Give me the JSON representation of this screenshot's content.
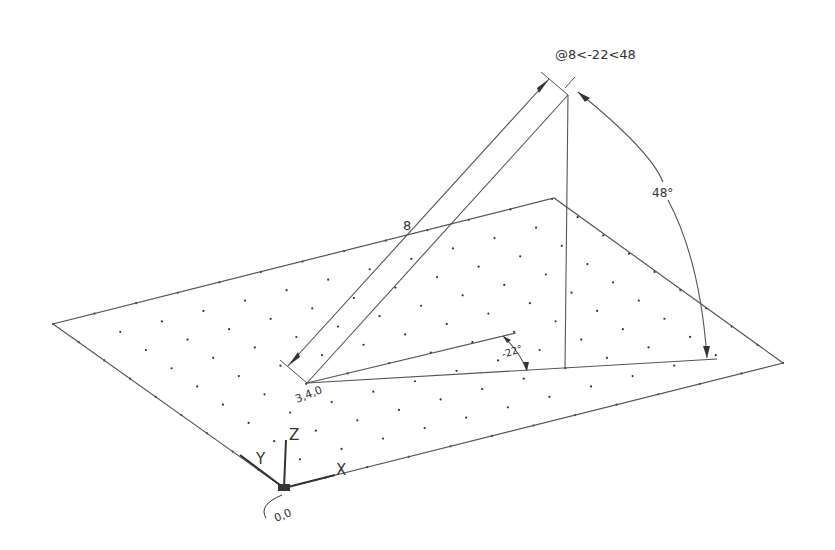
{
  "drawing": {
    "command_label": "@8<-22<48",
    "length_label": "8",
    "elevation_angle_label": "48°",
    "plan_angle_label": "-22°",
    "start_point_label": "3,4,0",
    "origin_label": "0,0",
    "axis_labels": {
      "x": "X",
      "y": "Y",
      "z": "Z"
    }
  },
  "colors": {
    "line": "#555555",
    "text": "#333333",
    "dot": "#333333",
    "background": "#ffffff"
  },
  "grid": {
    "x_divisions": 12,
    "y_divisions": 9
  }
}
